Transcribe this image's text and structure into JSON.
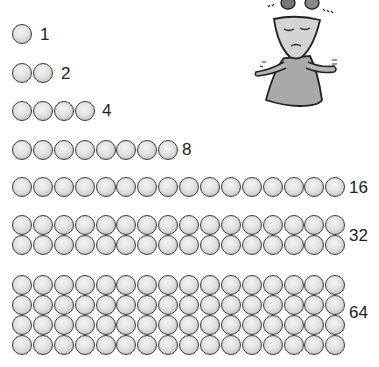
{
  "rows": [
    {
      "count": 1,
      "label": "1",
      "lines": 1,
      "per_line": 1,
      "top": 24,
      "label_x": 40,
      "label_y": 25
    },
    {
      "count": 2,
      "label": "2",
      "lines": 1,
      "per_line": 2,
      "top": 63,
      "label_x": 61,
      "label_y": 64
    },
    {
      "count": 4,
      "label": "4",
      "lines": 1,
      "per_line": 4,
      "top": 101,
      "label_x": 102,
      "label_y": 101
    },
    {
      "count": 8,
      "label": "8",
      "lines": 1,
      "per_line": 8,
      "top": 140,
      "label_x": 182,
      "label_y": 140
    },
    {
      "count": 16,
      "label": "16",
      "lines": 1,
      "per_line": 16,
      "top": 177,
      "label_x": 349,
      "label_y": 178
    },
    {
      "count": 32,
      "label": "32",
      "lines": 2,
      "per_line": 16,
      "top": 215,
      "label_x": 349,
      "label_y": 226
    },
    {
      "count": 64,
      "label": "64",
      "lines": 4,
      "per_line": 16,
      "top": 275,
      "label_x": 349,
      "label_y": 303
    }
  ],
  "figure": {
    "colors": {
      "body": "#b0b0b0",
      "head": "#d6d6d6",
      "outline": "#222222",
      "ball_dark": "#777777"
    }
  },
  "colors": {
    "ball_outline": "#3a3a3a",
    "ball_fill": "#e2e2e2",
    "label": "#222222",
    "background": "#ffffff"
  }
}
